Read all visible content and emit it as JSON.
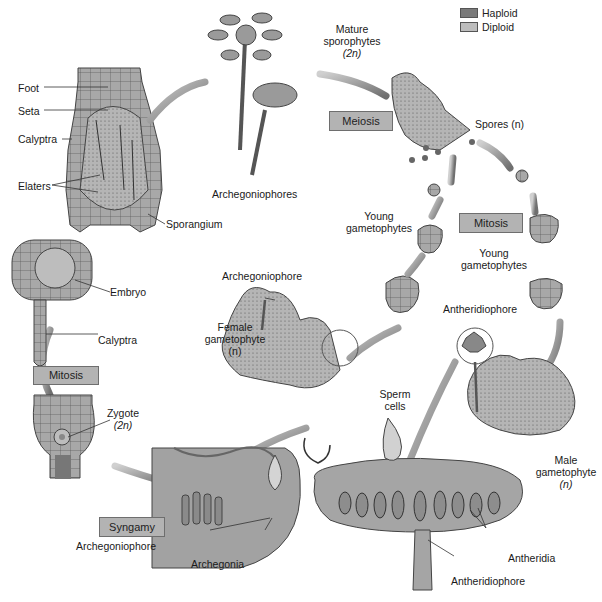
{
  "legend": {
    "items": [
      {
        "label": "Haploid",
        "color": "#7a7a7a"
      },
      {
        "label": "Diploid",
        "color": "#bdbdbd"
      }
    ]
  },
  "process_boxes": {
    "meiosis": "Meiosis",
    "mitosis_right": "Mitosis",
    "mitosis_left": "Mitosis",
    "syngamy": "Syngamy"
  },
  "labels": {
    "foot": "Foot",
    "seta": "Seta",
    "calyptra_top": "Calyptra",
    "elaters": "Elaters",
    "sporangium": "Sporangium",
    "archegoniophores_top": "Archegoniophores",
    "mature_sporophytes": [
      "Mature",
      "sporophytes",
      "(2n)"
    ],
    "spores": "Spores (n)",
    "young_gametophytes_left": [
      "Young",
      "gametophytes"
    ],
    "young_gametophytes_right": [
      "Young",
      "gametophytes"
    ],
    "archegoniophore_mid": "Archegoniophore",
    "female_gametophyte": [
      "Female",
      "gametophyte",
      "(n)"
    ],
    "antheridiophore_top": "Antheridiophore",
    "embryo": "Embryo",
    "calyptra_left": "Calyptra",
    "zygote": [
      "Zygote",
      "(2n)"
    ],
    "sperm_cells": [
      "Sperm",
      "cells"
    ],
    "male_gametophyte": [
      "Male",
      "gametophyte",
      "(n)"
    ],
    "archegoniophore_bottom": "Archegoniophore",
    "archegonia": "Archegonia",
    "antheridia": "Antheridia",
    "antheridiophore_bottom": "Antheridiophore"
  },
  "colors": {
    "tissue": "#a9a9a9",
    "tissue_dark": "#7d7d7d",
    "arrow": "#8a8a8a",
    "box_fill": "#b3b3b3"
  }
}
